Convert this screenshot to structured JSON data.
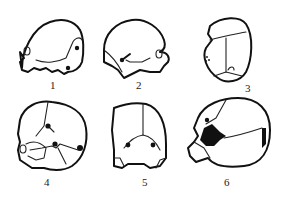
{
  "figure": {
    "panels": [
      {
        "id": "1",
        "label": "1",
        "view": "lateral-left"
      },
      {
        "id": "2",
        "label": "2",
        "view": "lateral-right"
      },
      {
        "id": "3",
        "label": "3",
        "view": "superior"
      },
      {
        "id": "4",
        "label": "4",
        "view": "posterolateral"
      },
      {
        "id": "5",
        "label": "5",
        "view": "posterior"
      },
      {
        "id": "6",
        "label": "6",
        "view": "posterolateral-oblique"
      }
    ]
  }
}
